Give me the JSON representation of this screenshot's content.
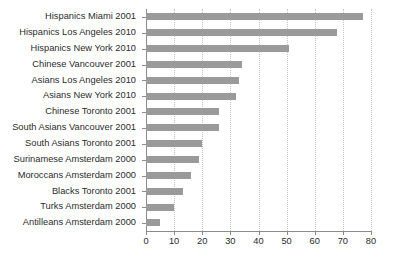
{
  "chart_data": {
    "type": "bar",
    "orientation": "horizontal",
    "title": "",
    "xlabel": "",
    "ylabel": "",
    "xlim": [
      0,
      80
    ],
    "xticks": [
      0,
      10,
      20,
      30,
      40,
      50,
      60,
      70,
      80
    ],
    "grid": "vertical-dotted",
    "legend": "none",
    "bar_color": "#9a9a9a",
    "text_color": "#2b2b2b",
    "axis_color": "#8a8a8a",
    "gridline_color": "#c4c4c4",
    "categories": [
      "Hispanics Miami 2001",
      "Hispanics Los Angeles 2010",
      "Hispanics New York 2010",
      "Chinese Vancouver 2001",
      "Asians Los Angeles 2010",
      "Asians New York 2010",
      "Chinese Toronto 2001",
      "South Asians Vancouver 2001",
      "South Asians Toronto 2001",
      "Surinamese Amsterdam 2000",
      "Moroccans Amsterdam 2000",
      "Blacks Toronto 2001",
      "Turks Amsterdam 2000",
      "Antilleans Amsterdam 2000"
    ],
    "values": [
      77,
      68,
      51,
      34,
      33,
      32,
      26,
      26,
      20,
      19,
      16,
      13,
      10,
      5
    ]
  }
}
